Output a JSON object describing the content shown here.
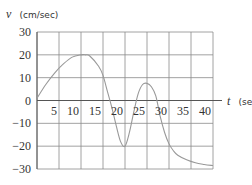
{
  "chart_data": {
    "type": "line",
    "title": "",
    "xlabel": "t (sec)",
    "ylabel": "v (cm/sec)",
    "x_var": "t",
    "x_unit": "(sec)",
    "y_var": "v",
    "y_unit": "(cm/sec)",
    "xlim": [
      0,
      40
    ],
    "ylim": [
      -30,
      30
    ],
    "x_ticks": [
      5,
      10,
      15,
      20,
      25,
      30,
      35,
      40
    ],
    "y_ticks": [
      30,
      20,
      10,
      0,
      -10,
      -20,
      -30
    ],
    "x_tick_labels": [
      "5",
      "10",
      "15",
      "20",
      "25",
      "30",
      "35",
      "40"
    ],
    "y_tick_labels": [
      "30",
      "20",
      "10",
      "0",
      "−10",
      "−20",
      "−30"
    ],
    "grid": true,
    "legend": null,
    "series": [
      {
        "name": "v(t)",
        "color": "#999999",
        "x": [
          0,
          2,
          4,
          6,
          8,
          10,
          11,
          12,
          14,
          15,
          16,
          17,
          18,
          19,
          20,
          21,
          22,
          23,
          24,
          25,
          26,
          27,
          28,
          29,
          30,
          31,
          32,
          34,
          36,
          38,
          40
        ],
        "y": [
          1,
          7,
          12,
          16,
          19,
          20,
          20,
          19.5,
          15,
          11,
          4,
          -3,
          -11,
          -18,
          -20,
          -14,
          -5,
          3,
          7,
          7.5,
          6,
          2,
          -7,
          -14,
          -19,
          -22,
          -24,
          -26,
          -27.3,
          -28,
          -28.5
        ]
      }
    ]
  },
  "colors": {
    "grid": "#8a8a8a",
    "axis": "#555555",
    "curve": "#999999",
    "text": "#333333"
  }
}
